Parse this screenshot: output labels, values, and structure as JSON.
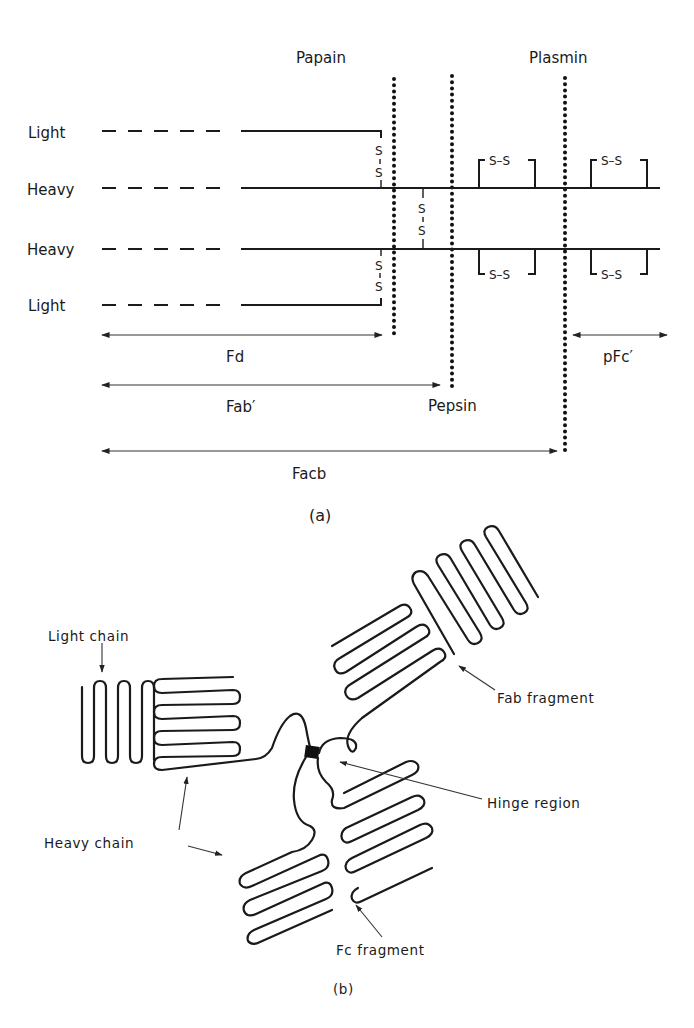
{
  "figure_a": {
    "caption": "(a)",
    "enzymes": {
      "papain": "Papain",
      "pepsin": "Pepsin",
      "plasmin": "Plasmin"
    },
    "chains": [
      {
        "label": "Light"
      },
      {
        "label": "Heavy"
      },
      {
        "label": "Heavy"
      },
      {
        "label": "Light"
      }
    ],
    "disulfide_label_top": "S",
    "disulfide_label_bottom": "S",
    "disulfide_pair": "S–S",
    "fragments": {
      "fd": "Fd",
      "fab_prime": "Fab′",
      "facb": "Facb",
      "pfc_prime": "pFc′"
    }
  },
  "figure_b": {
    "caption": "(b)",
    "labels": {
      "light_chain": "Light chain",
      "heavy_chain": "Heavy chain",
      "fab_fragment": "Fab fragment",
      "hinge_region": "Hinge region",
      "fc_fragment": "Fc fragment"
    }
  },
  "colors": {
    "ink": "#1a1a1a",
    "background": "#ffffff"
  }
}
